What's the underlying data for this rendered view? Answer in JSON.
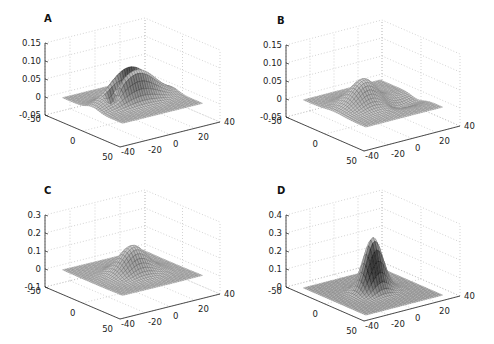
{
  "figure": {
    "panels": [
      "A",
      "B",
      "C",
      "D"
    ]
  },
  "chart_data": [
    {
      "label": "A",
      "type": "surface",
      "title": "",
      "xlabel": "",
      "ylabel": "",
      "zlabel": "",
      "xlim": [
        -50,
        50
      ],
      "ylim": [
        -40,
        40
      ],
      "zlim": [
        -0.05,
        0.15
      ],
      "xticks": [
        "-50",
        "0",
        "50"
      ],
      "yticks": [
        "-40",
        "-20",
        "0",
        "20",
        "40"
      ],
      "zticks": [
        "-0.05",
        "0",
        "0.05",
        "0.10",
        "0.15"
      ],
      "grid": true,
      "view": {
        "azimuth": -37.5,
        "elevation": 30
      },
      "surface": {
        "kind": "split-ridge",
        "peak": 0.12,
        "trough": -0.04,
        "sigma": 9
      }
    },
    {
      "label": "B",
      "type": "surface",
      "title": "",
      "xlabel": "",
      "ylabel": "",
      "zlabel": "",
      "xlim": [
        -50,
        50
      ],
      "ylim": [
        -40,
        40
      ],
      "zlim": [
        -0.05,
        0.15
      ],
      "xticks": [
        "-50",
        "0",
        "50"
      ],
      "yticks": [
        "-40",
        "-20",
        "0",
        "20",
        "40"
      ],
      "zticks": [
        "-0.05",
        "0",
        "0.05",
        "0.10",
        "0.15"
      ],
      "grid": true,
      "view": {
        "azimuth": -37.5,
        "elevation": 30
      },
      "surface": {
        "kind": "dipole",
        "peak": 0.08,
        "trough": -0.03,
        "sigma": 11
      }
    },
    {
      "label": "C",
      "type": "surface",
      "title": "",
      "xlabel": "",
      "ylabel": "",
      "zlabel": "",
      "xlim": [
        -50,
        50
      ],
      "ylim": [
        -40,
        40
      ],
      "zlim": [
        -0.1,
        0.3
      ],
      "xticks": [
        "-50",
        "0",
        "50"
      ],
      "yticks": [
        "-40",
        "-20",
        "0",
        "20",
        "40"
      ],
      "zticks": [
        "-0.1",
        "0",
        "0.1",
        "0.2",
        "0.3"
      ],
      "grid": true,
      "view": {
        "azimuth": -37.5,
        "elevation": 30
      },
      "surface": {
        "kind": "gaussian",
        "peak": 0.16,
        "trough": -0.01,
        "sigma": 10
      }
    },
    {
      "label": "D",
      "type": "surface",
      "title": "",
      "xlabel": "",
      "ylabel": "",
      "zlabel": "",
      "xlim": [
        -50,
        50
      ],
      "ylim": [
        -40,
        40
      ],
      "zlim": [
        0,
        0.4
      ],
      "xticks": [
        "-50",
        "0",
        "50"
      ],
      "yticks": [
        "-40",
        "-20",
        "0",
        "20",
        "40"
      ],
      "zticks": [
        "0",
        "0.1",
        "0.2",
        "0.3",
        "0.4"
      ],
      "grid": true,
      "view": {
        "azimuth": -37.5,
        "elevation": 30
      },
      "surface": {
        "kind": "gaussian",
        "peak": 0.3,
        "trough": 0,
        "sigma": 7
      }
    }
  ]
}
